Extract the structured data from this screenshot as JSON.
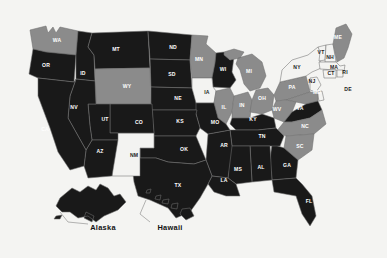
{
  "map": {
    "title": "United States choropleth map",
    "background_color": "#f4f4f2",
    "border_color": "#6f6f6f",
    "legend_tiers": [
      {
        "name": "dark",
        "color": "#191919"
      },
      {
        "name": "mid",
        "color": "#8b8b8b"
      },
      {
        "name": "light",
        "color": "#f3f3f1"
      }
    ],
    "insets": [
      {
        "id": "alaska",
        "label": "Alaska",
        "tier": "dark",
        "label_x": 103,
        "label_y": 230
      },
      {
        "id": "hawaii",
        "label": "Hawaii",
        "tier": "dark",
        "label_x": 170,
        "label_y": 230
      }
    ],
    "states": [
      {
        "code": "WA",
        "tier": "mid",
        "lx": 57,
        "ly": 41
      },
      {
        "code": "OR",
        "tier": "dark",
        "lx": 46,
        "ly": 66
      },
      {
        "code": "ID",
        "tier": "dark",
        "lx": 83,
        "ly": 74
      },
      {
        "code": "MT",
        "tier": "dark",
        "lx": 116,
        "ly": 50
      },
      {
        "code": "WY",
        "tier": "mid",
        "lx": 127,
        "ly": 87
      },
      {
        "code": "ND",
        "tier": "dark",
        "lx": 173,
        "ly": 48
      },
      {
        "code": "SD",
        "tier": "dark",
        "lx": 172,
        "ly": 75
      },
      {
        "code": "NE",
        "tier": "dark",
        "lx": 178,
        "ly": 99
      },
      {
        "code": "MN",
        "tier": "mid",
        "lx": 199,
        "ly": 60
      },
      {
        "code": "WI",
        "tier": "dark",
        "lx": 223,
        "ly": 70
      },
      {
        "code": "IA",
        "tier": "light",
        "lx": 207,
        "ly": 93
      },
      {
        "code": "MI",
        "tier": "mid",
        "lx": 249,
        "ly": 72
      },
      {
        "code": "IL",
        "tier": "mid",
        "lx": 224,
        "ly": 108
      },
      {
        "code": "IN",
        "tier": "mid",
        "lx": 242,
        "ly": 106
      },
      {
        "code": "OH",
        "tier": "mid",
        "lx": 262,
        "ly": 99
      },
      {
        "code": "PA",
        "tier": "mid",
        "lx": 292,
        "ly": 88
      },
      {
        "code": "NY",
        "tier": "light",
        "lx": 297,
        "ly": 68
      },
      {
        "code": "VT",
        "tier": "light",
        "lx": 321,
        "ly": 53
      },
      {
        "code": "NH",
        "tier": "light",
        "lx": 330,
        "ly": 58
      },
      {
        "code": "MA",
        "tier": "light",
        "lx": 334,
        "ly": 68
      },
      {
        "code": "CT",
        "tier": "light",
        "lx": 331,
        "ly": 74
      },
      {
        "code": "RI",
        "tier": "light",
        "lx": 345,
        "ly": 73
      },
      {
        "code": "ME",
        "tier": "mid",
        "lx": 338,
        "ly": 38
      },
      {
        "code": "NJ",
        "tier": "light",
        "lx": 312,
        "ly": 82
      },
      {
        "code": "DE",
        "tier": "light",
        "lx": 348,
        "ly": 90
      },
      {
        "code": "MD",
        "tier": "mid",
        "lx": 317,
        "ly": 93
      },
      {
        "code": "WV",
        "tier": "mid",
        "lx": 277,
        "ly": 110
      },
      {
        "code": "VA",
        "tier": "dark",
        "lx": 300,
        "ly": 109
      },
      {
        "code": "NC",
        "tier": "mid",
        "lx": 305,
        "ly": 127
      },
      {
        "code": "SC",
        "tier": "mid",
        "lx": 300,
        "ly": 147
      },
      {
        "code": "GA",
        "tier": "dark",
        "lx": 287,
        "ly": 166
      },
      {
        "code": "FL",
        "tier": "dark",
        "lx": 309,
        "ly": 202
      },
      {
        "code": "KY",
        "tier": "dark",
        "lx": 253,
        "ly": 120
      },
      {
        "code": "TN",
        "tier": "dark",
        "lx": 262,
        "ly": 137
      },
      {
        "code": "AL",
        "tier": "dark",
        "lx": 261,
        "ly": 168
      },
      {
        "code": "MS",
        "tier": "dark",
        "lx": 238,
        "ly": 170
      },
      {
        "code": "AR",
        "tier": "dark",
        "lx": 224,
        "ly": 146
      },
      {
        "code": "LA",
        "tier": "dark",
        "lx": 224,
        "ly": 181
      },
      {
        "code": "MO",
        "tier": "dark",
        "lx": 215,
        "ly": 123
      },
      {
        "code": "KS",
        "tier": "dark",
        "lx": 180,
        "ly": 122
      },
      {
        "code": "OK",
        "tier": "dark",
        "lx": 184,
        "ly": 150
      },
      {
        "code": "TX",
        "tier": "dark",
        "lx": 178,
        "ly": 186
      },
      {
        "code": "NM",
        "tier": "light",
        "lx": 134,
        "ly": 156
      },
      {
        "code": "CO",
        "tier": "dark",
        "lx": 139,
        "ly": 123
      },
      {
        "code": "UT",
        "tier": "dark",
        "lx": 105,
        "ly": 120
      },
      {
        "code": "AZ",
        "tier": "dark",
        "lx": 100,
        "ly": 152
      },
      {
        "code": "NV",
        "tier": "dark",
        "lx": 74,
        "ly": 108
      },
      {
        "code": "CA",
        "tier": "dark",
        "lx": 45,
        "ly": 130
      }
    ]
  }
}
